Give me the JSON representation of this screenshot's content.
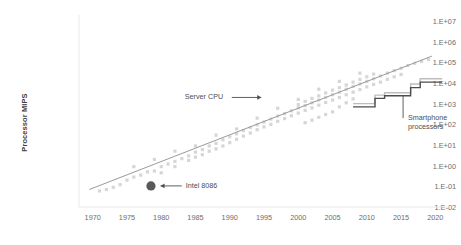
{
  "chart_data": {
    "type": "scatter",
    "title": "",
    "subtitle": "",
    "xlabel": "",
    "ylabel": "Processor MIPS",
    "grid": false,
    "legend_position": "none",
    "yscale": "log",
    "ytick_labels": [
      "1.E+07",
      "1.E+06",
      "1.E+05",
      "1.E+04",
      "1.E+03",
      "1.E+02",
      "1.E+01",
      "1.E+00",
      "1.E-01",
      "1.E-02"
    ],
    "ytick_values": [
      10000000,
      1000000,
      100000,
      10000,
      1000,
      100,
      10,
      1,
      0.1,
      0.01
    ],
    "ylim": [
      0.01,
      10000000
    ],
    "xtick_labels": [
      "1970",
      "1975",
      "1980",
      "1985",
      "1990",
      "1995",
      "2000",
      "2005",
      "2010",
      "2015",
      "2020"
    ],
    "xtick_values": [
      1970,
      1975,
      1980,
      1985,
      1990,
      1995,
      2000,
      2005,
      2010,
      2015,
      2020
    ],
    "xlim": [
      1968,
      2022
    ],
    "colors": {
      "scatter_point": "#d6d6d6",
      "trend_line": "#9a9a9a",
      "highlight_point": "#595959",
      "smartphone_line_light": "#bdbdbd",
      "smartphone_line_dark": "#4d4d4d",
      "axis": "#e8e8e8",
      "tick_text": "#6d6d6d",
      "axis_title": "#3f3f3f",
      "annotation_text": "#4d4d4d"
    },
    "annotations": [
      {
        "name": "server-cpu",
        "text": "Server CPU",
        "arrow": "right",
        "x": 1988.0,
        "y": 2000
      },
      {
        "name": "intel-8086",
        "text": "Intel 8086",
        "arrow": "left",
        "x": 1983.5,
        "y": 0.105
      },
      {
        "name": "smartphone-processors",
        "text": "Smartphone processors",
        "arrow": "leader-up",
        "x": 2015.0,
        "y": 200
      }
    ],
    "series": [
      {
        "name": "Processor MIPS scatter",
        "type": "scatter",
        "color": "#d6d6d6",
        "points": [
          [
            1971,
            0.06
          ],
          [
            1972,
            0.07
          ],
          [
            1973,
            0.09
          ],
          [
            1974,
            0.12
          ],
          [
            1975,
            0.2
          ],
          [
            1976,
            0.28
          ],
          [
            1977,
            0.35
          ],
          [
            1978,
            0.5
          ],
          [
            1979,
            0.55
          ],
          [
            1980,
            0.9
          ],
          [
            1980,
            0.45
          ],
          [
            1981,
            1.2
          ],
          [
            1982,
            1.6
          ],
          [
            1982,
            0.9
          ],
          [
            1983,
            2.2
          ],
          [
            1984,
            3.0
          ],
          [
            1984,
            1.8
          ],
          [
            1985,
            4.5
          ],
          [
            1985,
            2.6
          ],
          [
            1986,
            6.0
          ],
          [
            1986,
            3.4
          ],
          [
            1987,
            9.0
          ],
          [
            1987,
            5.0
          ],
          [
            1988,
            12
          ],
          [
            1988,
            6.5
          ],
          [
            1989,
            18
          ],
          [
            1989,
            9.0
          ],
          [
            1990,
            25
          ],
          [
            1990,
            13
          ],
          [
            1991,
            35
          ],
          [
            1991,
            19
          ],
          [
            1992,
            50
          ],
          [
            1992,
            27
          ],
          [
            1993,
            70
          ],
          [
            1993,
            38
          ],
          [
            1994,
            95
          ],
          [
            1994,
            55
          ],
          [
            1995,
            130
          ],
          [
            1995,
            75
          ],
          [
            1996,
            180
          ],
          [
            1996,
            100
          ],
          [
            1997,
            250
          ],
          [
            1997,
            140
          ],
          [
            1998,
            330
          ],
          [
            1998,
            190
          ],
          [
            1999,
            450
          ],
          [
            1999,
            260
          ],
          [
            2000,
            620
          ],
          [
            2000,
            350
          ],
          [
            2000,
            900
          ],
          [
            2001,
            800
          ],
          [
            2001,
            470
          ],
          [
            2001,
            1300
          ],
          [
            2002,
            1100
          ],
          [
            2002,
            620
          ],
          [
            2002,
            1800
          ],
          [
            2003,
            1500
          ],
          [
            2003,
            850
          ],
          [
            2003,
            2400
          ],
          [
            2004,
            2000
          ],
          [
            2004,
            1150
          ],
          [
            2004,
            3300
          ],
          [
            2005,
            2700
          ],
          [
            2005,
            1500
          ],
          [
            2005,
            4500
          ],
          [
            2006,
            3600
          ],
          [
            2006,
            2000
          ],
          [
            2006,
            6000
          ],
          [
            2007,
            5000
          ],
          [
            2007,
            2700
          ],
          [
            2007,
            8000
          ],
          [
            2008,
            6800
          ],
          [
            2008,
            3600
          ],
          [
            2008,
            11000
          ],
          [
            2009,
            9000
          ],
          [
            2009,
            4800
          ],
          [
            2009,
            15000
          ],
          [
            2010,
            12000
          ],
          [
            2010,
            6500
          ],
          [
            2010,
            20000
          ],
          [
            2011,
            16000
          ],
          [
            2011,
            8500
          ],
          [
            2011,
            27000
          ],
          [
            2012,
            22000
          ],
          [
            2012,
            11000
          ],
          [
            2013,
            30000
          ],
          [
            2013,
            15000
          ],
          [
            2014,
            40000
          ],
          [
            2014,
            20000
          ],
          [
            2015,
            52000
          ],
          [
            2015,
            26000
          ],
          [
            2016,
            70000
          ],
          [
            2017,
            90000
          ],
          [
            2018,
            110000
          ],
          [
            2019,
            140000
          ],
          [
            1976,
            0.9
          ],
          [
            1979,
            2.0
          ],
          [
            1982,
            5.0
          ],
          [
            1985,
            9.0
          ],
          [
            1988,
            30
          ],
          [
            1991,
            60
          ],
          [
            1994,
            200
          ],
          [
            1997,
            600
          ],
          [
            2000,
            1600
          ],
          [
            2003,
            5000
          ],
          [
            2006,
            12000
          ],
          [
            2009,
            30000
          ],
          [
            2005,
            400
          ],
          [
            2006,
            700
          ],
          [
            2007,
            1100
          ],
          [
            2008,
            1700
          ],
          [
            2004,
            300
          ],
          [
            2003,
            220
          ],
          [
            2002,
            160
          ],
          [
            2001,
            120
          ]
        ]
      },
      {
        "name": "Trend line",
        "type": "line",
        "color": "#9a9a9a",
        "points": [
          [
            1969.5,
            0.07
          ],
          [
            2019.5,
            200000
          ]
        ]
      },
      {
        "name": "Intel 8086",
        "type": "scatter-highlight",
        "color": "#595959",
        "points": [
          [
            1978.5,
            0.105
          ]
        ]
      },
      {
        "name": "Smartphone processors (upper)",
        "type": "step",
        "color": "#bdbdbd",
        "points": [
          [
            2008.0,
            1000
          ],
          [
            2011.2,
            1000
          ],
          [
            2011.2,
            2600
          ],
          [
            2012.6,
            2600
          ],
          [
            2012.6,
            3400
          ],
          [
            2016.4,
            3400
          ],
          [
            2016.4,
            9000
          ],
          [
            2017.8,
            9000
          ],
          [
            2017.8,
            16000
          ],
          [
            2021.0,
            16000
          ]
        ]
      },
      {
        "name": "Smartphone processors (lower)",
        "type": "step",
        "color": "#4d4d4d",
        "points": [
          [
            2008.0,
            700
          ],
          [
            2011.2,
            700
          ],
          [
            2011.2,
            1800
          ],
          [
            2012.6,
            1800
          ],
          [
            2012.6,
            2400
          ],
          [
            2016.4,
            2400
          ],
          [
            2016.4,
            6000
          ],
          [
            2017.8,
            6000
          ],
          [
            2017.8,
            11000
          ],
          [
            2021.0,
            11000
          ]
        ]
      }
    ]
  }
}
